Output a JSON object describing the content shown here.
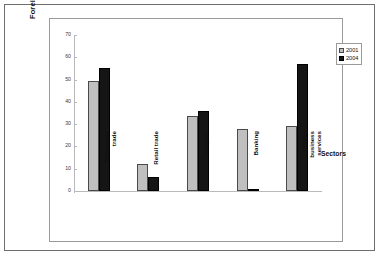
{
  "chart_data": {
    "type": "bar",
    "title": "",
    "xlabel": "Sectors",
    "ylabel": "Foreign share",
    "ylim": [
      0,
      70
    ],
    "ytick_step": 10,
    "yticks": [
      0,
      10,
      20,
      30,
      40,
      50,
      60,
      70
    ],
    "grid": false,
    "legend_position": "top-right",
    "categories": [
      "Wholesale\ntrade",
      "Retail trade",
      "Transport",
      "Banking",
      "Other\nbusiness\nservices"
    ],
    "series": [
      {
        "name": "2001",
        "color": "#bfbfbf",
        "values": [
          49.5,
          12,
          33.5,
          28,
          29
        ]
      },
      {
        "name": "2004",
        "color": "#151515",
        "values": [
          55,
          6.5,
          36,
          1,
          57
        ]
      }
    ]
  },
  "legend": {
    "items": [
      {
        "label": "2001"
      },
      {
        "label": "2004"
      }
    ]
  }
}
